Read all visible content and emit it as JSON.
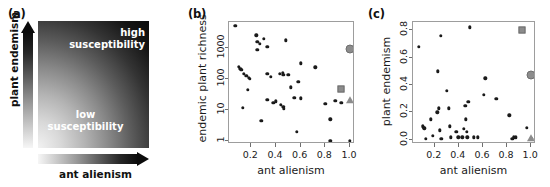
{
  "figure": {
    "panels": [
      "a",
      "b",
      "c"
    ]
  },
  "panel_a": {
    "label": "(a)",
    "x_axis_title": "ant alienism",
    "y_axis_title": "plant endemism",
    "region_high_line1": "high",
    "region_high_line2": "susceptibility",
    "region_low_line1": "low",
    "region_low_line2": "susceptibility",
    "gradient_light": "#f2f2f2",
    "gradient_dark": "#050505",
    "x_arrow_icon": "arrow-right-gradient",
    "y_arrow_icon": "arrow-up-gradient"
  },
  "chart_data": [
    {
      "panel": "b",
      "label": "(b)",
      "type": "scatter",
      "title": "",
      "xlabel": "ant alienism",
      "ylabel": "endemic plant richness",
      "xlim": [
        0.02,
        1.04
      ],
      "ylim": [
        0.8,
        7000
      ],
      "yscale": "log",
      "grid": false,
      "legend": "none",
      "xticks": [
        0.2,
        0.4,
        0.6,
        0.8,
        1.0
      ],
      "xticklabels": [
        "0.2",
        "0.4",
        "0.6",
        "0.8",
        "1.0"
      ],
      "yticks": [
        1,
        10,
        100,
        1000
      ],
      "yticklabels": [
        "1",
        "10",
        "100",
        "1000"
      ],
      "series": [
        {
          "name": "islands",
          "marker": "small-black-dot",
          "color": "#1a1a1a",
          "points": [
            [
              0.07,
              5200
            ],
            [
              0.1,
              250
            ],
            [
              0.11,
              220
            ],
            [
              0.12,
              200
            ],
            [
              0.13,
              12
            ],
            [
              0.14,
              150
            ],
            [
              0.16,
              130
            ],
            [
              0.17,
              45
            ],
            [
              0.18,
              110
            ],
            [
              0.19,
              100
            ],
            [
              0.24,
              2600
            ],
            [
              0.25,
              1600
            ],
            [
              0.25,
              900
            ],
            [
              0.27,
              1400
            ],
            [
              0.28,
              4.5
            ],
            [
              0.3,
              2000
            ],
            [
              0.33,
              150
            ],
            [
              0.33,
              1100
            ],
            [
              0.33,
              21
            ],
            [
              0.36,
              120
            ],
            [
              0.38,
              17
            ],
            [
              0.4,
              19
            ],
            [
              0.43,
              150
            ],
            [
              0.44,
              15
            ],
            [
              0.455,
              160
            ],
            [
              0.46,
              140
            ],
            [
              0.46,
              13
            ],
            [
              0.465,
              11
            ],
            [
              0.48,
              1800
            ],
            [
              0.5,
              140
            ],
            [
              0.52,
              55
            ],
            [
              0.55,
              25
            ],
            [
              0.57,
              2
            ],
            [
              0.58,
              80
            ],
            [
              0.6,
              24
            ],
            [
              0.6,
              320
            ],
            [
              0.72,
              240
            ],
            [
              0.8,
              16
            ],
            [
              0.84,
              5
            ],
            [
              0.84,
              1
            ],
            [
              0.88,
              20
            ],
            [
              0.93,
              17
            ],
            [
              1.0,
              20
            ],
            [
              1.0,
              1
            ]
          ]
        },
        {
          "name": "marker-circle",
          "marker": "gray-filled-circle",
          "color": "#8c8c8c",
          "points": [
            [
              1.0,
              950
            ]
          ]
        },
        {
          "name": "marker-square",
          "marker": "gray-filled-square",
          "color": "#8c8c8c",
          "points": [
            [
              0.925,
              48
            ]
          ]
        },
        {
          "name": "marker-triangle",
          "marker": "gray-filled-triangle",
          "color": "#8c8c8c",
          "points": [
            [
              1.0,
              21
            ]
          ]
        }
      ]
    },
    {
      "panel": "c",
      "label": "(c)",
      "type": "scatter",
      "title": "",
      "xlabel": "ant alienism",
      "ylabel": "plant endemism",
      "xlim": [
        0.02,
        1.04
      ],
      "ylim": [
        -0.03,
        0.86
      ],
      "yscale": "linear",
      "grid": false,
      "legend": "none",
      "xticks": [
        0.2,
        0.4,
        0.6,
        0.8,
        1.0
      ],
      "xticklabels": [
        "0.2",
        "0.4",
        "0.6",
        "0.8",
        "1.0"
      ],
      "yticks": [
        0.0,
        0.2,
        0.4,
        0.6,
        0.8
      ],
      "yticklabels": [
        "0.0",
        "0.2",
        "0.4",
        "0.6",
        "0.8"
      ],
      "series": [
        {
          "name": "islands",
          "marker": "small-black-dot",
          "color": "#1a1a1a",
          "points": [
            [
              0.07,
              0.68
            ],
            [
              0.1,
              0.1
            ],
            [
              0.11,
              0.09
            ],
            [
              0.115,
              0.085
            ],
            [
              0.125,
              0.01
            ],
            [
              0.17,
              0.15
            ],
            [
              0.185,
              0.03
            ],
            [
              0.22,
              0.2
            ],
            [
              0.225,
              0.5
            ],
            [
              0.235,
              0.23
            ],
            [
              0.24,
              0.07
            ],
            [
              0.25,
              0.76
            ],
            [
              0.255,
              0.01
            ],
            [
              0.3,
              0.36
            ],
            [
              0.315,
              0.23
            ],
            [
              0.325,
              0.1
            ],
            [
              0.335,
              0.02
            ],
            [
              0.38,
              0.06
            ],
            [
              0.395,
              0.02
            ],
            [
              0.43,
              0.02
            ],
            [
              0.44,
              0.08
            ],
            [
              0.455,
              0.25
            ],
            [
              0.46,
              0.15
            ],
            [
              0.465,
              0.06
            ],
            [
              0.47,
              0.02
            ],
            [
              0.48,
              0.28
            ],
            [
              0.49,
              0.82
            ],
            [
              0.525,
              0.02
            ],
            [
              0.555,
              0.02
            ],
            [
              0.605,
              0.33
            ],
            [
              0.62,
              0.45
            ],
            [
              0.71,
              0.3
            ],
            [
              0.82,
              0.18
            ],
            [
              0.845,
              0.01
            ],
            [
              0.855,
              0.02
            ],
            [
              0.87,
              0.02
            ],
            [
              0.965,
              0.09
            ],
            [
              1.0,
              0.01
            ]
          ]
        },
        {
          "name": "marker-circle",
          "marker": "gray-filled-circle",
          "color": "#8c8c8c",
          "points": [
            [
              1.0,
              0.47
            ]
          ]
        },
        {
          "name": "marker-square",
          "marker": "gray-filled-square",
          "color": "#8c8c8c",
          "points": [
            [
              0.92,
              0.8
            ]
          ]
        },
        {
          "name": "marker-triangle",
          "marker": "gray-filled-triangle",
          "color": "#8c8c8c",
          "points": [
            [
              1.0,
              0.015
            ]
          ]
        }
      ]
    }
  ]
}
